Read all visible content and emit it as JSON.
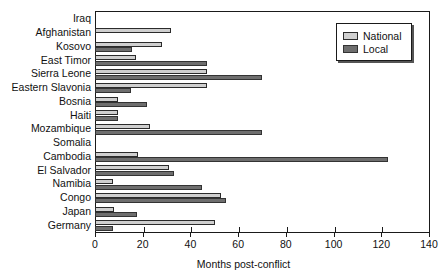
{
  "chart_data": {
    "type": "bar",
    "orientation": "horizontal",
    "title": "",
    "xlabel": "Months post-conflict",
    "ylabel": "",
    "xlim": [
      0,
      140
    ],
    "xticks": [
      0,
      20,
      40,
      60,
      80,
      100,
      120,
      140
    ],
    "xticklabels": [
      "0",
      "20",
      "40",
      "60",
      "80",
      "100",
      "120",
      "140"
    ],
    "grid": false,
    "legend_position": "upper right",
    "categories": [
      "Iraq",
      "Afghanistan",
      "Kosovo",
      "East Timor",
      "Sierra Leone",
      "Eastern Slavonia",
      "Bosnia",
      "Haiti",
      "Mozambique",
      "Somalia",
      "Cambodia",
      "El Salvador",
      "Namibia",
      "Congo",
      "Japan",
      "Germany"
    ],
    "series": [
      {
        "name": "National",
        "color": "#cfcfcf",
        "values": [
          0,
          32,
          28,
          17,
          47,
          47,
          9.5,
          9.5,
          23,
          0,
          18,
          31,
          7.5,
          53,
          8,
          50.5
        ]
      },
      {
        "name": "Local",
        "color": "#6e6e6e",
        "values": [
          0,
          0,
          15.5,
          47,
          70,
          15,
          22,
          9.5,
          70,
          0,
          123,
          33,
          45,
          55,
          17.5,
          7.5
        ]
      }
    ]
  },
  "legend": {
    "items": [
      {
        "label": "National",
        "swatch": "national"
      },
      {
        "label": "Local",
        "swatch": "local"
      }
    ]
  },
  "colors": {
    "national": "#cfcfcf",
    "local": "#6e6e6e",
    "axis": "#1a1a1a",
    "background": "#ffffff"
  }
}
